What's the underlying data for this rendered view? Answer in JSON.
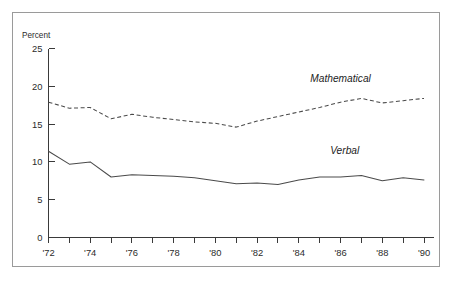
{
  "chart_data": {
    "type": "line",
    "title": "",
    "subtitle": "",
    "xlabel": "",
    "ylabel": "Percent",
    "ylim": [
      0,
      25
    ],
    "xlim": [
      1972,
      1990
    ],
    "yticks": [
      0,
      5,
      10,
      15,
      20,
      25
    ],
    "ytick_labels": [
      "0",
      "5",
      "10",
      "15",
      "20",
      "25"
    ],
    "xticks": [
      1972,
      1973,
      1974,
      1975,
      1976,
      1977,
      1978,
      1979,
      1980,
      1981,
      1982,
      1983,
      1984,
      1985,
      1986,
      1987,
      1988,
      1989,
      1990
    ],
    "xtick_labels": [
      "'72",
      "",
      "'74",
      "",
      "'76",
      "",
      "'78",
      "",
      "'80",
      "",
      "'82",
      "",
      "'84",
      "",
      "'86",
      "",
      "'88",
      "",
      "'90"
    ],
    "grid": false,
    "legend_position": "inline-annotation",
    "x": [
      1972,
      1973,
      1974,
      1975,
      1976,
      1977,
      1978,
      1979,
      1980,
      1981,
      1982,
      1983,
      1984,
      1985,
      1986,
      1987,
      1988,
      1989,
      1990
    ],
    "series": [
      {
        "name": "Mathematical",
        "style": "dashed",
        "color": "#4a4a4a",
        "label": "Mathematical",
        "label_x": 1986.0,
        "label_y": 20.6,
        "values": [
          17.9,
          17.1,
          17.2,
          15.7,
          16.3,
          15.9,
          15.6,
          15.3,
          15.1,
          14.6,
          15.4,
          16.0,
          16.6,
          17.2,
          17.9,
          18.4,
          17.8,
          18.1,
          18.4
        ]
      },
      {
        "name": "Verbal",
        "style": "solid",
        "color": "#4a4a4a",
        "label": "Verbal",
        "label_x": 1986.2,
        "label_y": 11.0,
        "values": [
          11.4,
          9.7,
          10.0,
          8.0,
          8.3,
          8.2,
          8.1,
          7.9,
          7.5,
          7.1,
          7.2,
          7.0,
          7.6,
          8.0,
          8.0,
          8.2,
          7.5,
          7.9,
          7.6
        ]
      }
    ]
  },
  "axes": {
    "y_axis_title": "Percent",
    "y_tick_labels": [
      "25",
      "20",
      "15",
      "10",
      "5",
      "0"
    ],
    "x_tick_labels": [
      "'72",
      "'74",
      "'76",
      "'78",
      "'80",
      "'82",
      "'84",
      "'86",
      "'88",
      "'90"
    ]
  },
  "annotations": {
    "mathematical_label": "Mathematical",
    "verbal_label": "Verbal"
  },
  "colors": {
    "line": "#4a4a4a",
    "axis": "#3a3a3a",
    "frame": "#9a9a9a",
    "text": "#2b2b2b",
    "background": "#ffffff"
  }
}
